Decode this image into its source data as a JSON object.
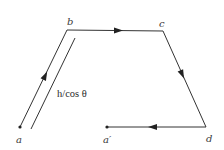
{
  "diagram": {
    "type": "closed-path-loop",
    "colors": {
      "line": "#333333",
      "text": "#3a3a3a",
      "background": "#ffffff"
    },
    "points": {
      "a": {
        "label": "a",
        "x": 20,
        "y": 127
      },
      "b": {
        "label": "b",
        "x": 67,
        "y": 30
      },
      "c": {
        "label": "c",
        "x": 163,
        "y": 31
      },
      "d": {
        "label": "d",
        "x": 206,
        "y": 127
      },
      "a_prime": {
        "label": "a′",
        "x": 107,
        "y": 127
      }
    },
    "segments": [
      {
        "from": "a",
        "to": "b",
        "arrow": "forward"
      },
      {
        "from": "b",
        "to": "c",
        "arrow": "forward"
      },
      {
        "from": "c",
        "to": "d",
        "arrow": "forward"
      },
      {
        "from": "d",
        "to": "a_prime",
        "arrow": "forward"
      }
    ],
    "dimension_line": {
      "label": "h/cos θ",
      "parallel_to": "a-b"
    }
  }
}
